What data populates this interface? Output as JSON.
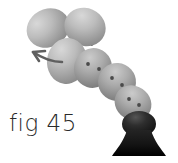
{
  "figure": {
    "caption": "fig 45",
    "background_color": "#ffffff",
    "ink_color": "#2a2a2a",
    "egg_light": "#cfcfcf",
    "egg_mid": "#a8a8a8",
    "egg_dark": "#6e6e6e",
    "dark_body": "#1e1e1e",
    "arrow_color": "#5a5a5a",
    "connector_color": "#1a1a1a",
    "dot_color": "#4a4a4a",
    "eggs": [
      {
        "name": "egg-top-left",
        "cx": 48,
        "cy": 28,
        "rx": 22,
        "ry": 19,
        "rot": -28,
        "tone": "light",
        "dots": 0
      },
      {
        "name": "egg-top-right",
        "cx": 85,
        "cy": 27,
        "rx": 21,
        "ry": 19,
        "rot": 24,
        "tone": "light",
        "dots": 0
      },
      {
        "name": "egg-chain-1",
        "cx": 67,
        "cy": 61,
        "rx": 20,
        "ry": 23,
        "rot": 8,
        "tone": "light",
        "dots": 0
      },
      {
        "name": "egg-chain-2",
        "cx": 93,
        "cy": 68,
        "rx": 19,
        "ry": 20,
        "rot": 18,
        "tone": "mid",
        "dots": 2
      },
      {
        "name": "egg-chain-3",
        "cx": 117,
        "cy": 82,
        "rx": 19,
        "ry": 19,
        "rot": 26,
        "tone": "mid",
        "dots": 2
      },
      {
        "name": "egg-chain-4",
        "cx": 133,
        "cy": 103,
        "rx": 19,
        "ry": 17,
        "rot": 34,
        "tone": "mid",
        "dots": 2
      },
      {
        "name": "egg-base-dark",
        "cx": 139,
        "cy": 124,
        "rx": 17,
        "ry": 13,
        "rot": 0,
        "tone": "dark",
        "dots": 0
      }
    ],
    "stand": {
      "name": "flared-base",
      "top_y": 130,
      "bottom_y": 156,
      "top_half_width": 12,
      "bottom_half_width": 27,
      "center_x": 139
    },
    "arrow": {
      "name": "motion-arrow",
      "direction": "up-left",
      "tail_path": "M 62 62 C 52 62 42 58 33 52",
      "head_points": "33 52 44 51 38 60"
    },
    "connector": {
      "name": "arc-connector",
      "path": "M 44 43 C 50 14 84 12 92 44"
    }
  }
}
